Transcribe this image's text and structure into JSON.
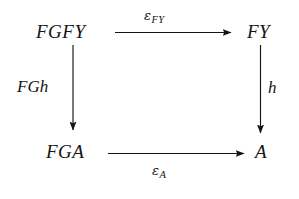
{
  "diagram": {
    "kind": "commutative-square",
    "background_color": "#ffffff",
    "ink_color": "#151515",
    "nodes": {
      "top_left": "FGFY",
      "top_right": "FY",
      "bottom_left": "FGA",
      "bottom_right": "A"
    },
    "arrows": {
      "top": {
        "from": "FGFY",
        "to": "FY",
        "direction": "right",
        "label_symbol": "ε",
        "label_subscript": "FY",
        "label_position": "above"
      },
      "bottom": {
        "from": "FGA",
        "to": "A",
        "direction": "right",
        "label_symbol": "ε",
        "label_subscript": "A",
        "label_position": "below"
      },
      "left": {
        "from": "FGFY",
        "to": "FGA",
        "direction": "down",
        "label": "FGh",
        "label_position": "left"
      },
      "right": {
        "from": "FY",
        "to": "A",
        "direction": "down",
        "label": "h",
        "label_position": "right"
      }
    }
  }
}
